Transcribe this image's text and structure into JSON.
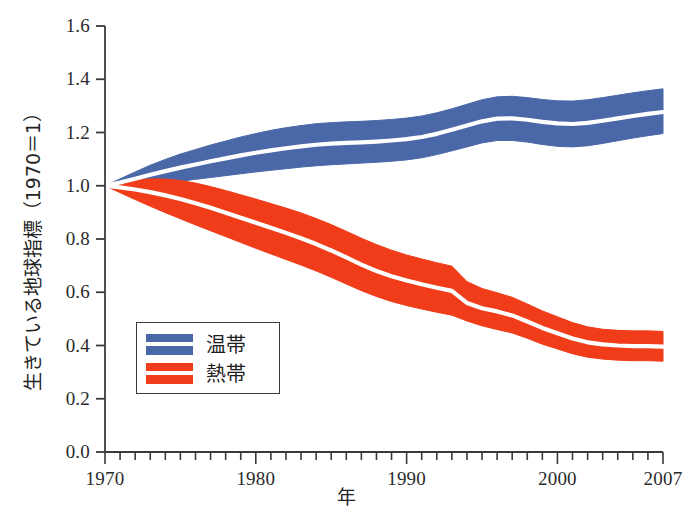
{
  "chart_data": {
    "type": "area",
    "title": "",
    "subtitle": "",
    "xlabel": "年",
    "ylabel": "生きている地球指標（1970＝1）",
    "xlim": [
      1970,
      2007
    ],
    "ylim": [
      0.0,
      1.6
    ],
    "grid": false,
    "legend_position": "lower-left",
    "xticks": [
      1970,
      1980,
      1990,
      2000,
      2007
    ],
    "xtick_labels": [
      "1970",
      "1980",
      "1990",
      "2000",
      "2007"
    ],
    "minor_xtick_interval": 1,
    "yticks": [
      0.0,
      0.2,
      0.4,
      0.6,
      0.8,
      1.0,
      1.2,
      1.4,
      1.6
    ],
    "ytick_labels": [
      "0.0",
      "0.2",
      "0.4",
      "0.6",
      "0.8",
      "1.0",
      "1.2",
      "1.4",
      "1.6"
    ],
    "x": [
      1970,
      1971,
      1972,
      1973,
      1974,
      1975,
      1976,
      1977,
      1978,
      1979,
      1980,
      1981,
      1982,
      1983,
      1984,
      1985,
      1986,
      1987,
      1988,
      1989,
      1990,
      1991,
      1992,
      1993,
      1994,
      1995,
      1996,
      1997,
      1998,
      1999,
      2000,
      2001,
      2002,
      2003,
      2004,
      2005,
      2006,
      2007
    ],
    "series": [
      {
        "name": "温帯",
        "color": "#4a68a8",
        "median_line_color": "#ffffff",
        "values": [
          1.0,
          1.012,
          1.026,
          1.041,
          1.055,
          1.068,
          1.08,
          1.092,
          1.103,
          1.114,
          1.124,
          1.133,
          1.141,
          1.148,
          1.154,
          1.158,
          1.161,
          1.163,
          1.166,
          1.17,
          1.175,
          1.183,
          1.195,
          1.21,
          1.226,
          1.242,
          1.252,
          1.253,
          1.248,
          1.24,
          1.234,
          1.232,
          1.236,
          1.244,
          1.253,
          1.262,
          1.27,
          1.277
        ],
        "lower": [
          1.0,
          0.998,
          1.0,
          1.005,
          1.011,
          1.017,
          1.024,
          1.031,
          1.038,
          1.045,
          1.052,
          1.058,
          1.064,
          1.07,
          1.075,
          1.079,
          1.082,
          1.085,
          1.088,
          1.092,
          1.097,
          1.105,
          1.117,
          1.131,
          1.146,
          1.161,
          1.17,
          1.17,
          1.164,
          1.155,
          1.148,
          1.146,
          1.15,
          1.159,
          1.169,
          1.179,
          1.188,
          1.196
        ],
        "upper": [
          1.0,
          1.026,
          1.052,
          1.077,
          1.099,
          1.119,
          1.136,
          1.153,
          1.168,
          1.183,
          1.196,
          1.208,
          1.218,
          1.226,
          1.233,
          1.237,
          1.24,
          1.242,
          1.245,
          1.249,
          1.254,
          1.262,
          1.274,
          1.289,
          1.306,
          1.323,
          1.334,
          1.336,
          1.331,
          1.324,
          1.319,
          1.318,
          1.323,
          1.331,
          1.34,
          1.349,
          1.357,
          1.364
        ]
      },
      {
        "name": "熱帯",
        "color": "#f03c18",
        "median_line_color": "#ffffff",
        "values": [
          1.0,
          0.994,
          0.986,
          0.976,
          0.964,
          0.95,
          0.934,
          0.917,
          0.899,
          0.88,
          0.861,
          0.842,
          0.823,
          0.803,
          0.781,
          0.757,
          0.731,
          0.704,
          0.68,
          0.66,
          0.644,
          0.63,
          0.617,
          0.605,
          0.56,
          0.54,
          0.528,
          0.513,
          0.49,
          0.466,
          0.446,
          0.426,
          0.412,
          0.404,
          0.4,
          0.398,
          0.398,
          0.396
        ],
        "lower": [
          1.0,
          0.974,
          0.948,
          0.923,
          0.899,
          0.876,
          0.853,
          0.831,
          0.809,
          0.787,
          0.765,
          0.744,
          0.723,
          0.702,
          0.68,
          0.656,
          0.631,
          0.606,
          0.584,
          0.565,
          0.55,
          0.537,
          0.525,
          0.514,
          0.492,
          0.474,
          0.46,
          0.447,
          0.427,
          0.405,
          0.387,
          0.369,
          0.356,
          0.349,
          0.345,
          0.343,
          0.343,
          0.341
        ],
        "upper": [
          1.0,
          1.014,
          1.022,
          1.026,
          1.025,
          1.02,
          1.01,
          0.997,
          0.982,
          0.966,
          0.95,
          0.933,
          0.916,
          0.898,
          0.877,
          0.854,
          0.829,
          0.803,
          0.779,
          0.758,
          0.74,
          0.725,
          0.711,
          0.698,
          0.64,
          0.614,
          0.598,
          0.581,
          0.556,
          0.53,
          0.508,
          0.486,
          0.47,
          0.461,
          0.457,
          0.455,
          0.455,
          0.453
        ]
      }
    ]
  },
  "legend": {
    "items": [
      {
        "label": "温帯",
        "color": "#4a68a8"
      },
      {
        "label": "熱帯",
        "color": "#f03c18"
      }
    ]
  },
  "axes": {
    "y_title": "生きている地球指標（1970＝1）",
    "x_title": "年",
    "axis_color": "#3a3a3a"
  }
}
